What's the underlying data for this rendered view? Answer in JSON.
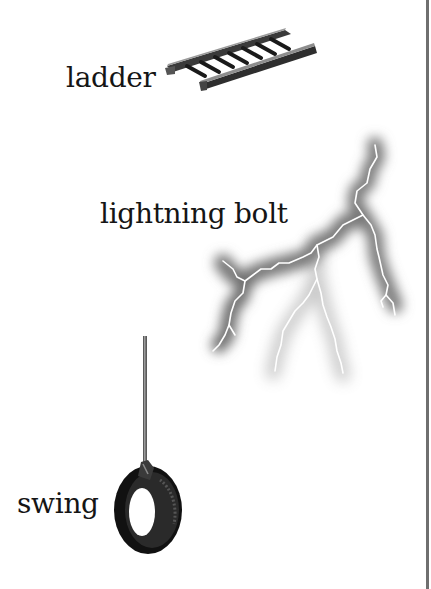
{
  "words": [
    {
      "id": "ladder",
      "label": "ladder",
      "picture": "ladder-icon"
    },
    {
      "id": "lightning",
      "label": "lightning bolt",
      "picture": "lightning-bolt-icon"
    },
    {
      "id": "swing",
      "label": "swing",
      "picture": "tire-swing-icon"
    }
  ],
  "colors": {
    "text": "#151515",
    "divider": "#6f6f6f",
    "background": "#ffffff"
  }
}
